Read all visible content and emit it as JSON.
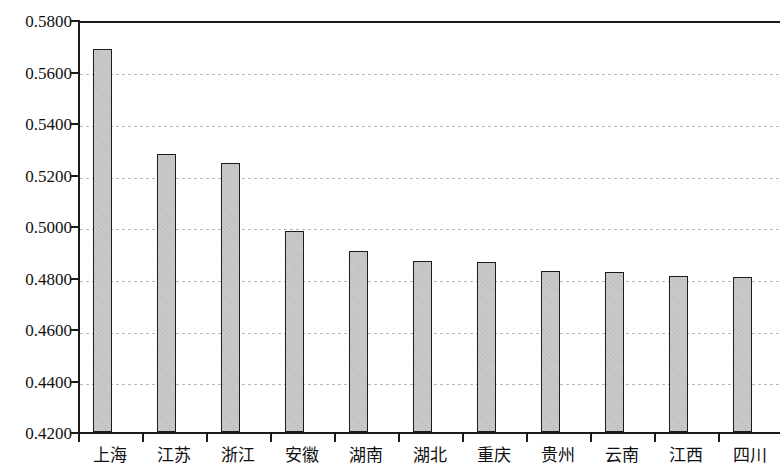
{
  "chart_data": {
    "type": "bar",
    "title": "",
    "subtitle": "",
    "xlabel": "",
    "ylabel": "",
    "categories": [
      "上海",
      "江苏",
      "浙江",
      "安徽",
      "湖南",
      "湖北",
      "重庆",
      "贵州",
      "云南",
      "江西",
      "四川"
    ],
    "values": [
      0.5697,
      0.5287,
      0.5252,
      0.4986,
      0.4907,
      0.4868,
      0.4866,
      0.483,
      0.4826,
      0.4809,
      0.4805
    ],
    "ylim": [
      0.42,
      0.58
    ],
    "ytick_labels": [
      "0.5800",
      "0.5600",
      "0.5400",
      "0.5200",
      "0.5000",
      "0.4800",
      "0.4600",
      "0.4400",
      "0.4200"
    ],
    "ytick_values": [
      0.58,
      0.56,
      0.54,
      0.52,
      0.5,
      0.48,
      0.46,
      0.44,
      0.42
    ],
    "ytick_step": 0.02,
    "grid": true,
    "grid_axis": "y",
    "grid_style": "dotted",
    "legend": null,
    "legend_position": "none",
    "annotations": [],
    "series": [
      {
        "name": "",
        "values": [
          0.5697,
          0.5287,
          0.5252,
          0.4986,
          0.4907,
          0.4868,
          0.4866,
          0.483,
          0.4826,
          0.4809,
          0.4805
        ]
      }
    ],
    "colors": {
      "bar_fill": "#c9c9c9",
      "bar_border": "#1c1c1c",
      "axis": "#1a1a1a",
      "gridline": "#b9b9b9",
      "background": "#ffffff",
      "text": "#111111"
    }
  }
}
